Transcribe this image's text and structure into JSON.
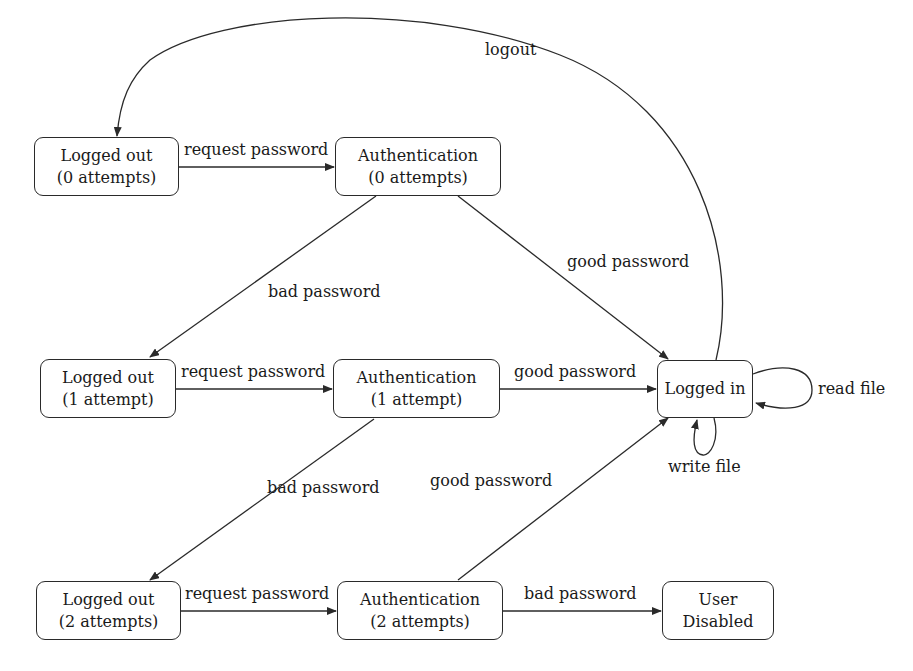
{
  "diagram": {
    "type": "state-machine",
    "colors": {
      "stroke": "#2a2a2a",
      "text": "#1a1a1a",
      "background": "#ffffff"
    },
    "nodes": {
      "lo0": {
        "line1": "Logged out",
        "line2": "(0 attempts)"
      },
      "a0": {
        "line1": "Authentication",
        "line2": "(0 attempts)"
      },
      "lo1": {
        "line1": "Logged out",
        "line2": "(1 attempt)"
      },
      "a1": {
        "line1": "Authentication",
        "line2": "(1 attempt)"
      },
      "li": {
        "line1": "Logged in"
      },
      "lo2": {
        "line1": "Logged out",
        "line2": "(2 attempts)"
      },
      "a2": {
        "line1": "Authentication",
        "line2": "(2 attempts)"
      },
      "ud": {
        "line1": "User",
        "line2": "Disabled"
      }
    },
    "edges": {
      "lo0_a0": {
        "from": "lo0",
        "to": "a0",
        "label": "request password"
      },
      "a0_lo1": {
        "from": "a0",
        "to": "lo1",
        "label": "bad password"
      },
      "a0_li": {
        "from": "a0",
        "to": "li",
        "label": "good password"
      },
      "lo1_a1": {
        "from": "lo1",
        "to": "a1",
        "label": "request password"
      },
      "a1_li": {
        "from": "a1",
        "to": "li",
        "label": "good password"
      },
      "a1_lo2": {
        "from": "a1",
        "to": "lo2",
        "label": "bad password"
      },
      "lo2_a2": {
        "from": "lo2",
        "to": "a2",
        "label": "request password"
      },
      "a2_li": {
        "from": "a2",
        "to": "li",
        "label": "good password"
      },
      "a2_ud": {
        "from": "a2",
        "to": "ud",
        "label": "bad password"
      },
      "li_lo0": {
        "from": "li",
        "to": "lo0",
        "label": "logout"
      },
      "li_read": {
        "from": "li",
        "to": "li",
        "label": "read file"
      },
      "li_write": {
        "from": "li",
        "to": "li",
        "label": "write file"
      }
    }
  }
}
